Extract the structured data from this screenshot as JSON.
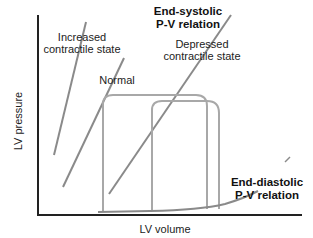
{
  "diagram": {
    "title_labels": {
      "espvr": [
        "End-systolic",
        "P-V relation"
      ],
      "edpvr": [
        "End-diastolic",
        "P-V relation"
      ]
    },
    "curve_labels": {
      "increased": [
        "Increased",
        "contractile state"
      ],
      "normal": "Normal",
      "depressed": [
        "Depressed",
        "contractile state"
      ]
    },
    "axes": {
      "x_label": "LV volume",
      "y_label": "LV pressure"
    },
    "colors": {
      "axis": "#222222",
      "lines": "#8a8a8a",
      "loops": "#a8a8a8",
      "text": "#222222"
    }
  }
}
